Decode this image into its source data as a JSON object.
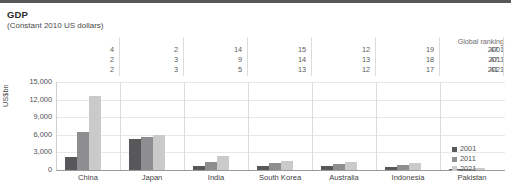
{
  "header": {
    "title": "GDP",
    "subtitle": "(Constant 2010 US dollars)"
  },
  "ranking": {
    "caption": "Global ranking",
    "years": [
      "2001",
      "2011",
      "2021"
    ],
    "rows": [
      {
        "year": "2001",
        "values": [
          "4",
          "2",
          "14",
          "15",
          "12",
          "19",
          "47"
        ]
      },
      {
        "year": "2011",
        "values": [
          "2",
          "3",
          "9",
          "14",
          "13",
          "18",
          "47"
        ]
      },
      {
        "year": "2021",
        "values": [
          "2",
          "3",
          "5",
          "13",
          "12",
          "17",
          "41"
        ]
      }
    ]
  },
  "legend": {
    "position": "right",
    "items": [
      {
        "label": "2001",
        "color": "#58585a"
      },
      {
        "label": "2011",
        "color": "#8e8e90"
      },
      {
        "label": "2021",
        "color": "#cacaca"
      }
    ]
  },
  "colors": {
    "series_2001": "#58585a",
    "series_2011": "#8e8e90",
    "series_2021": "#cacaca",
    "top_rule": "#58585a",
    "gridline": "#e8e8e8",
    "axis": "#9a9a9a"
  },
  "chart_data": {
    "type": "bar",
    "title": "GDP",
    "subtitle": "(Constant 2010 US dollars)",
    "xlabel": "",
    "ylabel": "US$bn",
    "ylim": [
      0,
      15000
    ],
    "yticks": [
      "0",
      "3,000",
      "6,000",
      "9,000",
      "12,000",
      "15,000"
    ],
    "ytick_values": [
      0,
      3000,
      6000,
      9000,
      12000,
      15000
    ],
    "grid": true,
    "legend_position": "right",
    "categories": [
      "China",
      "Japan",
      "India",
      "South Korea",
      "Australia",
      "Indonesia",
      "Pakistan"
    ],
    "series": [
      {
        "name": "2001",
        "color": "#58585a",
        "values": [
          2300,
          5350,
          750,
          700,
          750,
          500,
          130
        ]
      },
      {
        "name": "2011",
        "color": "#8e8e90",
        "values": [
          6500,
          5600,
          1400,
          1150,
          1050,
          780,
          200
        ]
      },
      {
        "name": "2021",
        "color": "#cacaca",
        "values": [
          12700,
          5900,
          2350,
          1500,
          1350,
          1150,
          320
        ]
      }
    ],
    "annotations": {
      "global_ranking": {
        "caption": "Global ranking",
        "2001": [
          4,
          2,
          14,
          15,
          12,
          19,
          47
        ],
        "2011": [
          2,
          3,
          9,
          14,
          13,
          18,
          47
        ],
        "2021": [
          2,
          3,
          5,
          13,
          12,
          17,
          41
        ]
      }
    }
  }
}
